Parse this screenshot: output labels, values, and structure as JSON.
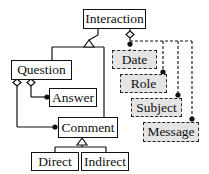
{
  "diagram": {
    "type": "UML class diagram",
    "classes": {
      "interaction": "Interaction",
      "question": "Question",
      "answer": "Answer",
      "comment": "Comment",
      "direct": "Direct",
      "indirect": "Indirect"
    },
    "attributes": {
      "date": "Date",
      "role": "Role",
      "subject": "Subject",
      "message": "Message"
    },
    "relations": [
      {
        "from": "Question",
        "to": "Interaction",
        "kind": "generalization"
      },
      {
        "from": "Comment",
        "to": "Interaction",
        "kind": "generalization"
      },
      {
        "from": "Question",
        "to": "Answer",
        "kind": "aggregation"
      },
      {
        "from": "Question",
        "to": "Comment",
        "kind": "aggregation"
      },
      {
        "from": "Direct",
        "to": "Comment",
        "kind": "generalization"
      },
      {
        "from": "Indirect",
        "to": "Comment",
        "kind": "generalization"
      },
      {
        "from": "Interaction",
        "to": "Date",
        "kind": "aggregation-optional"
      },
      {
        "from": "Interaction",
        "to": "Role",
        "kind": "aggregation-optional"
      },
      {
        "from": "Interaction",
        "to": "Subject",
        "kind": "aggregation-optional"
      },
      {
        "from": "Interaction",
        "to": "Message",
        "kind": "aggregation-optional"
      }
    ],
    "colors": {
      "line": "#111111",
      "attribute_fill": "#e4e4e4",
      "background": "#ffffff"
    }
  }
}
